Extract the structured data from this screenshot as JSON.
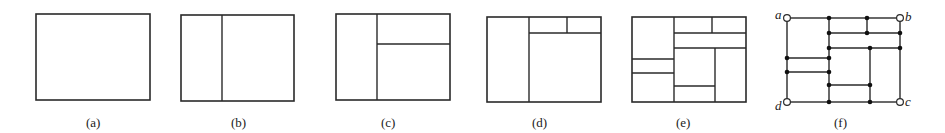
{
  "figure": {
    "panels": [
      {
        "id": "a",
        "caption": "(a)"
      },
      {
        "id": "b",
        "caption": "(b)"
      },
      {
        "id": "c",
        "caption": "(c)"
      },
      {
        "id": "d",
        "caption": "(d)"
      },
      {
        "id": "e",
        "caption": "(e)"
      },
      {
        "id": "f",
        "caption": "(f)"
      }
    ],
    "graph_labels": {
      "a": "a",
      "b": "b",
      "c": "c",
      "d": "d"
    }
  }
}
